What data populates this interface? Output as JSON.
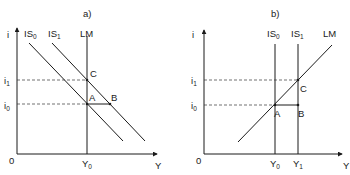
{
  "panels": [
    {
      "id": "a",
      "title": "a)",
      "y_axis_label": "i",
      "x_axis_label": "Y",
      "origin_label": "0",
      "curves": [
        {
          "name": "IS",
          "sub": "0",
          "type": "downward-sloping"
        },
        {
          "name": "IS",
          "sub": "1",
          "type": "downward-sloping"
        },
        {
          "name": "LM",
          "sub": "",
          "type": "vertical"
        }
      ],
      "points": [
        "A",
        "B",
        "C"
      ],
      "y_ticks": [
        {
          "name": "i",
          "sub": "1"
        },
        {
          "name": "i",
          "sub": "0"
        }
      ],
      "x_ticks": [
        {
          "name": "Y",
          "sub": "0"
        }
      ]
    },
    {
      "id": "b",
      "title": "b)",
      "y_axis_label": "i",
      "x_axis_label": "Y",
      "origin_label": "0",
      "curves": [
        {
          "name": "IS",
          "sub": "0",
          "type": "vertical"
        },
        {
          "name": "IS",
          "sub": "1",
          "type": "vertical"
        },
        {
          "name": "LM",
          "sub": "",
          "type": "upward-sloping"
        }
      ],
      "points": [
        "A",
        "B",
        "C"
      ],
      "y_ticks": [
        {
          "name": "i",
          "sub": "1"
        },
        {
          "name": "i",
          "sub": "0"
        }
      ],
      "x_ticks": [
        {
          "name": "Y",
          "sub": "0"
        },
        {
          "name": "Y",
          "sub": "1"
        }
      ]
    }
  ]
}
